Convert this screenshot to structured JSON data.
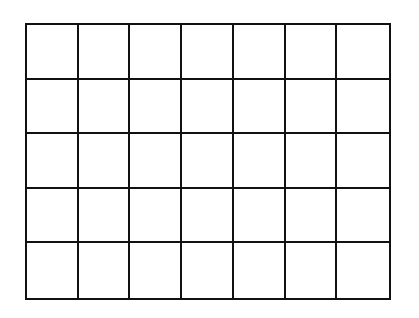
{
  "grid": {
    "rows": 5,
    "columns": 7,
    "line_color": "#111111",
    "background": "#ffffff"
  }
}
